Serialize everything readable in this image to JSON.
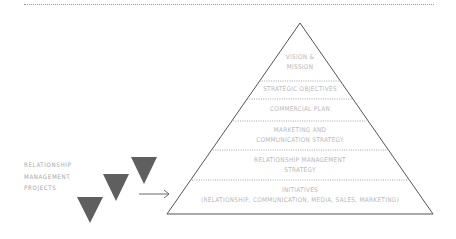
{
  "diagram": {
    "type": "pyramid",
    "levels": [
      {
        "id": "vision",
        "line1": "VISION &",
        "line2": "MISSION"
      },
      {
        "id": "objectives",
        "line1": "STRATEGIC OBJECTIVES"
      },
      {
        "id": "commercial",
        "line1": "COMMERCIAL PLAN"
      },
      {
        "id": "marketing",
        "line1": "MARKETING AND",
        "line2": "COMMUNICATION STRATEGY"
      },
      {
        "id": "rm-strategy",
        "line1": "RELATIONSHIP MANAGEMENT",
        "line2": "STRATEGY"
      },
      {
        "id": "initiatives",
        "line1": "INITIATIVES",
        "line2": "(RELATIONSHIP, COMMUNICATION, MEDIA, SALES, MARKETING)"
      }
    ],
    "side_label": {
      "line1": "RELATIONSHIP",
      "line2": "MANAGEMENT",
      "line3": "PROJECTS"
    },
    "colors": {
      "outline": "#555555",
      "divider": "#9a9a9a",
      "triangle_fill": "#5f5f5f",
      "text": "#b8b8b8"
    }
  }
}
